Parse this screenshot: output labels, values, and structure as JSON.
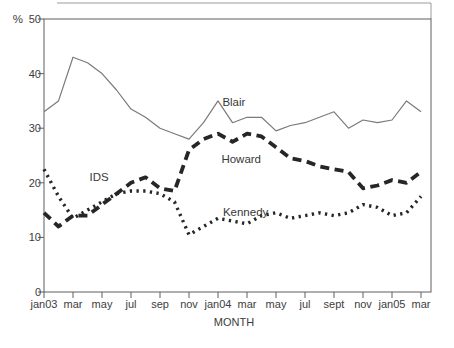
{
  "chart_data": {
    "type": "line",
    "title": "",
    "x_axis": {
      "label": "MONTH",
      "tick_labels": [
        "jan03",
        "mar",
        "may",
        "jul",
        "sep",
        "nov",
        "jan04",
        "mar",
        "may",
        "jul",
        "sept",
        "nov",
        "jan05",
        "mar"
      ],
      "months": [
        "jan03",
        "feb03",
        "mar03",
        "apr03",
        "may03",
        "jun03",
        "jul03",
        "aug03",
        "sep03",
        "oct03",
        "nov03",
        "dec03",
        "jan04",
        "feb04",
        "mar04",
        "apr04",
        "may04",
        "jun04",
        "jul04",
        "aug04",
        "sept04",
        "oct04",
        "nov04",
        "dec04",
        "jan05",
        "feb05",
        "mar05"
      ]
    },
    "y_axis": {
      "label": "%",
      "ticks": [
        0,
        10,
        20,
        30,
        40,
        50
      ],
      "range": [
        0,
        50
      ]
    },
    "grid": "off",
    "legend": "inline-labels",
    "series": [
      {
        "name": "Blair",
        "line_style": "solid",
        "color": "#7a7a7a",
        "values": [
          33,
          35,
          43,
          42,
          40,
          37,
          33.5,
          32,
          30,
          29,
          28,
          31,
          35,
          31,
          32,
          32,
          29.5,
          30.5,
          31,
          32,
          33,
          30,
          31.5,
          31,
          31.5,
          35,
          33
        ]
      },
      {
        "name": "IDS / Howard",
        "line_style": "dashed",
        "color": "#262626",
        "values": [
          14.5,
          12,
          14,
          14,
          16,
          18,
          20,
          21,
          19,
          18.5,
          26,
          28,
          29,
          27.5,
          29,
          28.5,
          26.5,
          24.5,
          24,
          23,
          22.5,
          22,
          19,
          19.5,
          20.5,
          20,
          22
        ]
      },
      {
        "name": "Kennedy",
        "line_style": "dotted",
        "color": "#262626",
        "values": [
          22.5,
          17.5,
          13.5,
          15,
          16.5,
          18,
          18.5,
          18.5,
          18,
          16.5,
          10.5,
          12,
          13.5,
          13,
          12.5,
          14,
          14.5,
          13.5,
          14,
          14.5,
          14,
          14.5,
          16,
          15.5,
          14,
          14.5,
          17.5
        ]
      }
    ],
    "annotations": [
      {
        "text": "IDS",
        "x_index": 3.8,
        "value": 21.0
      },
      {
        "text": "Blair",
        "x_index": 13.1,
        "value": 34.8
      },
      {
        "text": "Howard",
        "x_index": 13.6,
        "value": 24.3
      },
      {
        "text": "Kennedy",
        "x_index": 13.9,
        "value": 14.7
      }
    ]
  }
}
